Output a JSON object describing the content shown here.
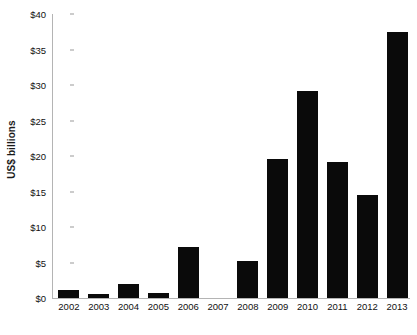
{
  "chart_data": {
    "type": "bar",
    "title": "",
    "subtitle": "",
    "xlabel": "",
    "ylabel": "US$ billions",
    "categories": [
      "2002",
      "2003",
      "2004",
      "2005",
      "2006",
      "2007",
      "2008",
      "2009",
      "2010",
      "2011",
      "2012",
      "2013"
    ],
    "values": [
      1.1,
      0.5,
      2.0,
      0.7,
      7.2,
      0.0,
      5.2,
      19.6,
      29.2,
      19.2,
      14.5,
      37.5
    ],
    "series": [
      {
        "name": "US$ billions",
        "values": [
          1.1,
          0.5,
          2.0,
          0.7,
          7.2,
          0.0,
          5.2,
          19.6,
          29.2,
          19.2,
          14.5,
          37.5
        ]
      }
    ],
    "ylim": [
      0,
      40
    ],
    "ytick_values": [
      0,
      5,
      10,
      15,
      20,
      25,
      30,
      35,
      40
    ],
    "ytick_labels": [
      "$0",
      "$5",
      "$10",
      "$15",
      "$20",
      "$25",
      "$30",
      "$35",
      "$40"
    ],
    "grid": false,
    "legend": false,
    "legend_position": "none",
    "bar_color": "#0a0a0a",
    "axis_color": "#b4b4b4",
    "background_color": "#ffffff",
    "annotations": [
      "2007 has no bar (zero value)"
    ]
  }
}
